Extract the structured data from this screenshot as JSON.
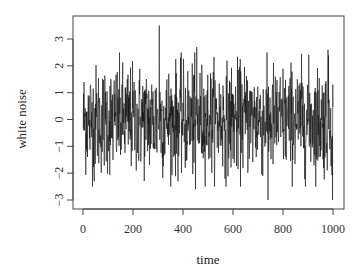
{
  "chart_data": {
    "type": "line",
    "title": "",
    "xlabel": "time",
    "ylabel": "white noise",
    "xlim": [
      0,
      1000
    ],
    "ylim": [
      -3.2,
      3.6
    ],
    "xticks": [
      0,
      200,
      400,
      600,
      800,
      1000
    ],
    "yticks": [
      -3,
      -2,
      -1,
      0,
      1,
      2,
      3
    ],
    "grid": false,
    "legend": null,
    "n_points": 1000,
    "distribution": "Gaussian white noise, mean 0, sd 1",
    "notable_points": [
      {
        "x": 305,
        "y": 3.5
      },
      {
        "x": 455,
        "y": 2.7
      },
      {
        "x": 980,
        "y": 2.6
      },
      {
        "x": 740,
        "y": -3.0
      },
      {
        "x": 998,
        "y": -3.0
      },
      {
        "x": 450,
        "y": -2.6
      },
      {
        "x": 45,
        "y": -2.3
      }
    ],
    "series": [
      {
        "name": "white noise",
        "color": "#000000"
      }
    ]
  },
  "plot_box": {
    "left": 73,
    "top": 16,
    "right": 344,
    "bottom": 209
  },
  "mapping": {
    "x0_px": 83,
    "x1000_px": 333,
    "y3_px": 39,
    "yneg3_px": 200
  }
}
